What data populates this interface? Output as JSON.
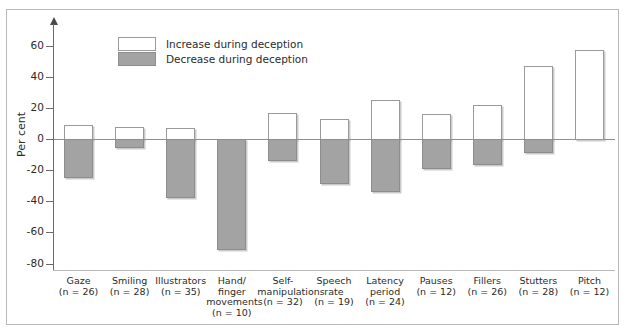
{
  "chart_data": {
    "type": "bar",
    "title": "",
    "subtitle": "",
    "xlabel": "",
    "ylabel": "Per cent",
    "ylim": [
      -80,
      70
    ],
    "yticks": [
      60,
      40,
      20,
      0,
      -20,
      -40,
      -60,
      -80
    ],
    "ytick_labels": [
      "60",
      "40",
      "20",
      "0",
      "-20",
      "-40",
      "-60",
      "-80"
    ],
    "grid": false,
    "legend_position": "top-left-inside",
    "legend": [
      {
        "key": "increase",
        "label": "Increase during deception",
        "color": "#ffffff"
      },
      {
        "key": "decrease",
        "label": "Decrease during deception",
        "color": "#a3a3a3"
      }
    ],
    "categories": [
      "Gaze",
      "Smiling",
      "Illustrators",
      "Hand/\nfinger\nmovements",
      "Self-\nmanipulations",
      "Speech\nrate",
      "Latency\nperiod",
      "Pauses",
      "Fillers",
      "Stutters",
      "Pitch"
    ],
    "category_sample_labels": [
      "(n = 26)",
      "(n = 28)",
      "(n = 35)",
      "(n = 10)",
      "(n = 32)",
      "(n = 19)",
      "(n = 24)",
      "(n = 12)",
      "(n = 26)",
      "(n = 28)",
      "(n = 12)"
    ],
    "sample_sizes": [
      26,
      28,
      35,
      10,
      32,
      19,
      24,
      12,
      26,
      28,
      12
    ],
    "series": [
      {
        "name": "Increase during deception",
        "values": [
          9,
          7.5,
          7,
          0,
          17,
          13,
          25,
          16,
          22,
          47,
          57
        ]
      },
      {
        "name": "Decrease during deception",
        "values": [
          -25,
          -5.5,
          -38,
          -71,
          -14,
          -29,
          -34,
          -19,
          -17,
          -9,
          0
        ]
      }
    ]
  },
  "axis": {
    "y_title": "Per cent"
  }
}
